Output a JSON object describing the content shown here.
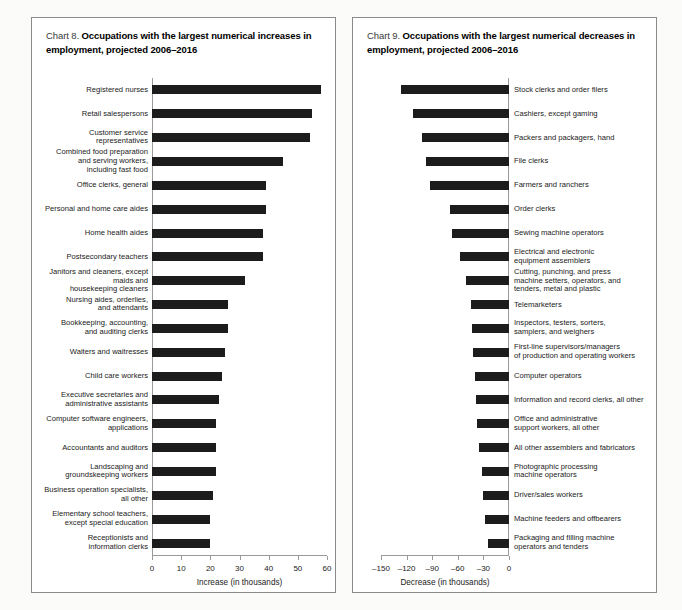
{
  "document": {
    "background_color": "#fbfbfa",
    "bar_color": "#1c1c1c",
    "axis_color": "#9a9a9a"
  },
  "charts": [
    {
      "panel_name": "chart-8-panel",
      "title_lead": "Chart 8.",
      "title_bold": "Occupations with the largest numerical increases in employment, projected 2006–2016"
    },
    {
      "panel_name": "chart-9-panel",
      "title_lead": "Chart 9.",
      "title_bold": "Occupations with the largest numerical decreases in employment, projected 2006–2016"
    }
  ],
  "chart_data": [
    {
      "type": "bar",
      "orientation": "horizontal",
      "title": "Chart 8. Occupations with the largest numerical increases in employment, projected 2006–2016",
      "xlabel": "Increase (in thousands)",
      "ylabel": "",
      "xlim": [
        0,
        60
      ],
      "xticks": [
        0,
        10,
        20,
        30,
        40,
        50,
        60
      ],
      "xtick_labels": [
        "0",
        "10",
        "20",
        "30",
        "40",
        "50",
        "60"
      ],
      "grid": false,
      "legend": null,
      "categories": [
        "Registered nurses",
        "Retail salespersons",
        "Customer service\nrepresentatives",
        "Combined food preparation\nand serving workers,\nincluding fast food",
        "Office clerks, general",
        "Personal and home care aides",
        "Home health aides",
        "Postsecondary teachers",
        "Janitors and cleaners, except\nmaids and\nhousekeeping cleaners",
        "Nursing aides, orderlies,\nand attendants",
        "Bookkeeping, accounting,\nand auditing clerks",
        "Waiters and waitresses",
        "Child care workers",
        "Executive secretaries and\nadministrative assistants",
        "Computer software engineers,\napplications",
        "Accountants and auditors",
        "Landscaping and\ngroundskeeping workers",
        "Business operation specialists,\nall other",
        "Elementary school teachers,\nexcept special education",
        "Receptionists and\ninformation clerks"
      ],
      "values": [
        58,
        55,
        54,
        45,
        39,
        39,
        38,
        38,
        32,
        26,
        26,
        25,
        24,
        23,
        22,
        22,
        22,
        21,
        20,
        20
      ]
    },
    {
      "type": "bar",
      "orientation": "horizontal",
      "title": "Chart 9. Occupations with the largest numerical decreases in employment, projected 2006–2016",
      "xlabel": "Decrease (in thousands)",
      "ylabel": "",
      "xlim": [
        -150,
        0
      ],
      "xticks": [
        -150,
        -120,
        -90,
        -60,
        -30,
        0
      ],
      "xtick_labels": [
        "–150",
        "–120",
        "–90",
        "–60",
        "–30",
        "0"
      ],
      "grid": false,
      "legend": null,
      "categories": [
        "Stock clerks and order filers",
        "Cashiers, except gaming",
        "Packers and packagers, hand",
        "File clerks",
        "Farmers and ranchers",
        "Order clerks",
        "Sewing machine operators",
        "Electrical and electronic\nequipment assemblers",
        "Cutting, punching, and press\nmachine setters, operators, and\ntenders, metal and plastic",
        "Telemarketers",
        "Inspectors, testers, sorters,\nsamplers, and weighers",
        "First-line supervisors/managers\nof production and operating workers",
        "Computer operators",
        "Information and record clerks, all other",
        "Office and administrative\nsupport workers, all other",
        "All other assemblers and fabricators",
        "Photographic processing\nmachine operators",
        "Driver/sales workers",
        "Machine feeders and offbearers",
        "Packaging and filling machine\noperators and tenders"
      ],
      "values": [
        -127,
        -112,
        -102,
        -97,
        -93,
        -69,
        -67,
        -57,
        -50,
        -45,
        -43,
        -42,
        -40,
        -39,
        -37,
        -35,
        -32,
        -31,
        -28,
        -25
      ]
    }
  ]
}
